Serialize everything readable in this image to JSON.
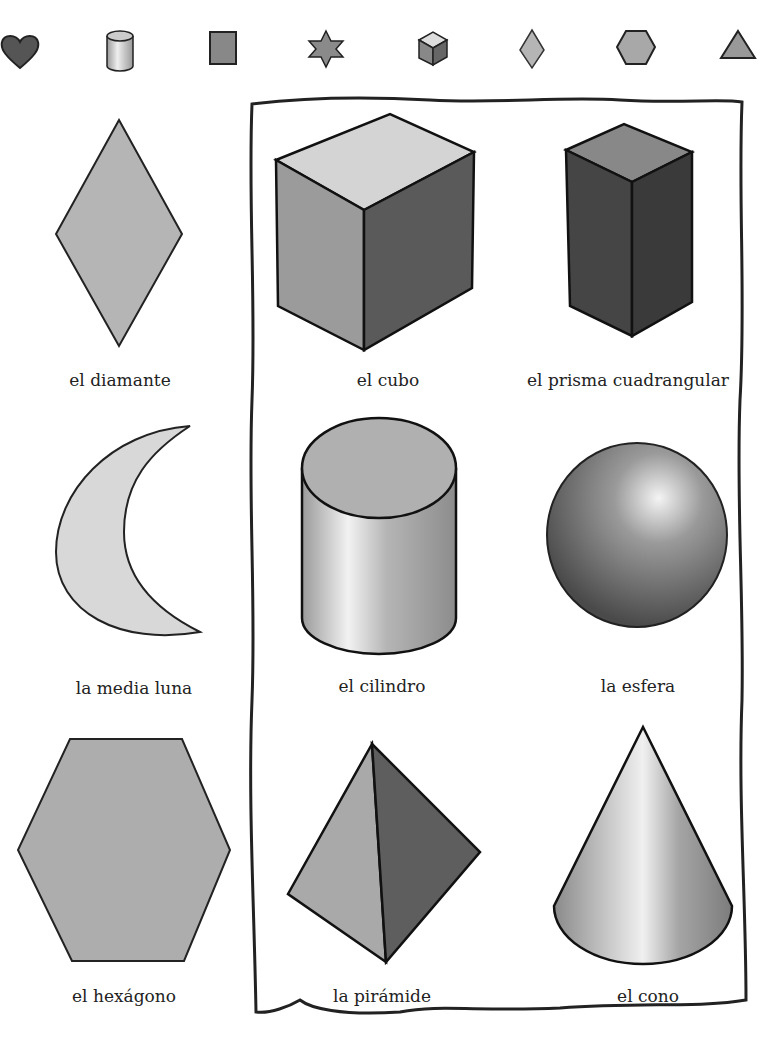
{
  "top_icons": [
    {
      "name": "heart",
      "color": "#555555"
    },
    {
      "name": "cylinder",
      "color": "#b0b0b0"
    },
    {
      "name": "rectangle",
      "color": "#888888"
    },
    {
      "name": "star",
      "color": "#8a8a8a"
    },
    {
      "name": "cube",
      "color": "#a0a0a0"
    },
    {
      "name": "diamond",
      "color": "#b5b5b5"
    },
    {
      "name": "hexagon",
      "color": "#a8a8a8"
    },
    {
      "name": "triangle",
      "color": "#999999"
    }
  ],
  "shapes": [
    {
      "id": "diamond",
      "label": "el diamante"
    },
    {
      "id": "cube",
      "label": "el cubo"
    },
    {
      "id": "square-prism",
      "label": "el prisma cuadrangular"
    },
    {
      "id": "crescent",
      "label": "la media luna"
    },
    {
      "id": "cylinder",
      "label": "el cilindro"
    },
    {
      "id": "sphere",
      "label": "la esfera"
    },
    {
      "id": "hexagon",
      "label": "el hexágono"
    },
    {
      "id": "pyramid",
      "label": "la pirámide"
    },
    {
      "id": "cone",
      "label": "el cono"
    }
  ]
}
